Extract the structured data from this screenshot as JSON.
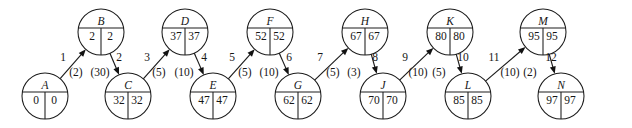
{
  "diagram": {
    "stroke_color": "#1c1c1c",
    "text_color": "#161616",
    "background_color": "#ffffff",
    "node_radius": 23,
    "top_row_y": 32,
    "bottom_row_y": 96,
    "nodes": [
      {
        "id": "A",
        "label": "A",
        "left_value": "0",
        "right_value": "0",
        "cx": 45,
        "cy": 96,
        "row": "bottom"
      },
      {
        "id": "B",
        "label": "B",
        "left_value": "2",
        "right_value": "2",
        "cx": 101,
        "cy": 32,
        "row": "top"
      },
      {
        "id": "C",
        "label": "C",
        "left_value": "32",
        "right_value": "32",
        "cx": 128,
        "cy": 96,
        "row": "bottom"
      },
      {
        "id": "D",
        "label": "D",
        "left_value": "37",
        "right_value": "37",
        "cx": 185,
        "cy": 32,
        "row": "top"
      },
      {
        "id": "E",
        "label": "E",
        "left_value": "47",
        "right_value": "47",
        "cx": 213,
        "cy": 96,
        "row": "bottom"
      },
      {
        "id": "F",
        "label": "F",
        "left_value": "52",
        "right_value": "52",
        "cx": 270,
        "cy": 32,
        "row": "top"
      },
      {
        "id": "G",
        "label": "G",
        "left_value": "62",
        "right_value": "62",
        "cx": 298,
        "cy": 96,
        "row": "bottom"
      },
      {
        "id": "H",
        "label": "H",
        "left_value": "67",
        "right_value": "67",
        "cx": 365,
        "cy": 32,
        "row": "top"
      },
      {
        "id": "J",
        "label": "J",
        "left_value": "70",
        "right_value": "70",
        "cx": 383,
        "cy": 96,
        "row": "bottom"
      },
      {
        "id": "K",
        "label": "K",
        "left_value": "80",
        "right_value": "80",
        "cx": 450,
        "cy": 32,
        "row": "top"
      },
      {
        "id": "L",
        "label": "L",
        "left_value": "85",
        "right_value": "85",
        "cx": 468,
        "cy": 96,
        "row": "bottom"
      },
      {
        "id": "M",
        "label": "M",
        "left_value": "95",
        "right_value": "95",
        "cx": 543,
        "cy": 32,
        "row": "top"
      },
      {
        "id": "N",
        "label": "N",
        "left_value": "97",
        "right_value": "97",
        "cx": 561,
        "cy": 96,
        "row": "bottom"
      }
    ],
    "edges": [
      {
        "ordinal": "1",
        "weight": "(2)",
        "from": "A",
        "to": "B",
        "direction": "up",
        "ord_x": 63,
        "ord_y": 61,
        "w_x": 76,
        "w_y": 76
      },
      {
        "ordinal": "2",
        "weight": "(30)",
        "from": "B",
        "to": "C",
        "direction": "down",
        "ord_x": 119,
        "ord_y": 61,
        "w_x": 100,
        "w_y": 76
      },
      {
        "ordinal": "3",
        "weight": "(5)",
        "from": "C",
        "to": "D",
        "direction": "up",
        "ord_x": 147,
        "ord_y": 61,
        "w_x": 159,
        "w_y": 76
      },
      {
        "ordinal": "4",
        "weight": "(10)",
        "from": "D",
        "to": "E",
        "direction": "down",
        "ord_x": 204,
        "ord_y": 61,
        "w_x": 184,
        "w_y": 76
      },
      {
        "ordinal": "5",
        "weight": "(5)",
        "from": "E",
        "to": "F",
        "direction": "up",
        "ord_x": 232,
        "ord_y": 61,
        "w_x": 245,
        "w_y": 76
      },
      {
        "ordinal": "6",
        "weight": "(10)",
        "from": "F",
        "to": "G",
        "direction": "down",
        "ord_x": 289,
        "ord_y": 61,
        "w_x": 269,
        "w_y": 76
      },
      {
        "ordinal": "7",
        "weight": "(5)",
        "from": "G",
        "to": "H",
        "direction": "up",
        "ord_x": 320,
        "ord_y": 61,
        "w_x": 333,
        "w_y": 76
      },
      {
        "ordinal": "8",
        "weight": "(3)",
        "from": "H",
        "to": "J",
        "direction": "down",
        "ord_x": 375,
        "ord_y": 61,
        "w_x": 354,
        "w_y": 76
      },
      {
        "ordinal": "9",
        "weight": "(10)",
        "from": "J",
        "to": "K",
        "direction": "up",
        "ord_x": 405,
        "ord_y": 61,
        "w_x": 418,
        "w_y": 76
      },
      {
        "ordinal": "10",
        "weight": "(5)",
        "from": "K",
        "to": "L",
        "direction": "down",
        "ord_x": 463,
        "ord_y": 61,
        "w_x": 439,
        "w_y": 76
      },
      {
        "ordinal": "11",
        "weight": "(10)",
        "from": "L",
        "to": "M",
        "direction": "up",
        "ord_x": 494,
        "ord_y": 61,
        "w_x": 510,
        "w_y": 76
      },
      {
        "ordinal": "12",
        "weight": "(2)",
        "from": "M",
        "to": "N",
        "direction": "down",
        "ord_x": 551,
        "ord_y": 61,
        "w_x": 530,
        "w_y": 76
      }
    ]
  }
}
